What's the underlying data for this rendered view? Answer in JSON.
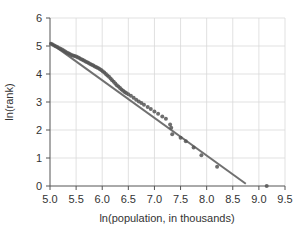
{
  "chart_data": {
    "type": "scatter",
    "title": "",
    "xlabel": "ln(population, in thousands)",
    "ylabel": "ln(rank)",
    "xlim": [
      5.0,
      9.5
    ],
    "ylim": [
      0,
      6
    ],
    "x_ticks": [
      "5.0",
      "5.5",
      "6.0",
      "6.5",
      "7.0",
      "7.5",
      "8.0",
      "8.5",
      "9.0",
      "9.5"
    ],
    "y_ticks": [
      "0",
      "1",
      "2",
      "3",
      "4",
      "5",
      "6"
    ],
    "grid": true,
    "legend": null,
    "series": [
      {
        "name": "cities",
        "kind": "scatter",
        "color": "#555555",
        "points": [
          [
            5.02,
            5.08
          ],
          [
            5.05,
            5.05
          ],
          [
            5.08,
            5.02
          ],
          [
            5.11,
            4.99
          ],
          [
            5.14,
            4.96
          ],
          [
            5.17,
            4.93
          ],
          [
            5.2,
            4.9
          ],
          [
            5.23,
            4.87
          ],
          [
            5.26,
            4.84
          ],
          [
            5.29,
            4.8
          ],
          [
            5.32,
            4.77
          ],
          [
            5.35,
            4.74
          ],
          [
            5.38,
            4.71
          ],
          [
            5.41,
            4.68
          ],
          [
            5.44,
            4.66
          ],
          [
            5.47,
            4.64
          ],
          [
            5.5,
            4.62
          ],
          [
            5.53,
            4.6
          ],
          [
            5.56,
            4.57
          ],
          [
            5.59,
            4.54
          ],
          [
            5.62,
            4.51
          ],
          [
            5.65,
            4.48
          ],
          [
            5.68,
            4.45
          ],
          [
            5.71,
            4.42
          ],
          [
            5.74,
            4.39
          ],
          [
            5.77,
            4.36
          ],
          [
            5.8,
            4.33
          ],
          [
            5.83,
            4.3
          ],
          [
            5.86,
            4.27
          ],
          [
            5.89,
            4.24
          ],
          [
            5.92,
            4.21
          ],
          [
            5.95,
            4.18
          ],
          [
            5.98,
            4.14
          ],
          [
            6.01,
            4.1
          ],
          [
            6.04,
            4.05
          ],
          [
            6.07,
            4.0
          ],
          [
            6.1,
            3.95
          ],
          [
            6.13,
            3.9
          ],
          [
            6.16,
            3.84
          ],
          [
            6.19,
            3.78
          ],
          [
            6.22,
            3.72
          ],
          [
            6.25,
            3.66
          ],
          [
            6.28,
            3.6
          ],
          [
            6.31,
            3.55
          ],
          [
            6.34,
            3.5
          ],
          [
            6.37,
            3.45
          ],
          [
            6.4,
            3.4
          ],
          [
            6.43,
            3.36
          ],
          [
            6.46,
            3.32
          ],
          [
            6.5,
            3.28
          ],
          [
            6.55,
            3.22
          ],
          [
            6.6,
            3.15
          ],
          [
            6.65,
            3.08
          ],
          [
            6.7,
            3.02
          ],
          [
            6.75,
            2.96
          ],
          [
            6.8,
            2.9
          ],
          [
            6.87,
            2.82
          ],
          [
            6.93,
            2.75
          ],
          [
            7.0,
            2.66
          ],
          [
            7.07,
            2.58
          ],
          [
            7.15,
            2.48
          ],
          [
            7.22,
            2.4
          ],
          [
            7.3,
            2.2
          ],
          [
            7.32,
            2.08
          ],
          [
            7.34,
            1.85
          ],
          [
            7.5,
            1.72
          ],
          [
            7.6,
            1.6
          ],
          [
            7.75,
            1.38
          ],
          [
            7.9,
            1.1
          ],
          [
            8.2,
            0.69
          ],
          [
            9.15,
            0.0
          ]
        ]
      },
      {
        "name": "fitted line",
        "kind": "line",
        "color": "#707070",
        "points": [
          [
            5.0,
            5.12
          ],
          [
            8.75,
            0.08
          ]
        ]
      }
    ]
  }
}
